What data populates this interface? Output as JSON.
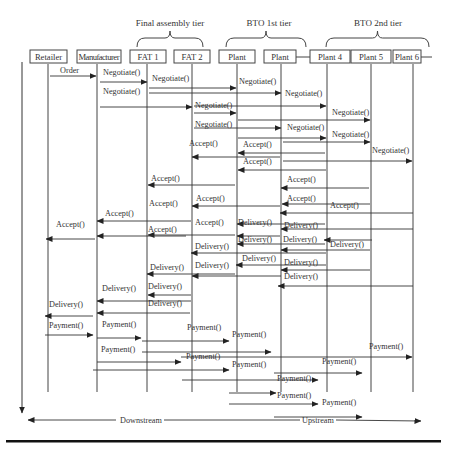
{
  "tiers": [
    {
      "label": "Final assembly tier",
      "x1": 137,
      "x2": 203,
      "tx": 170,
      "ty": 26
    },
    {
      "label": "BTO 1st tier",
      "x1": 226,
      "x2": 306,
      "tx": 269,
      "ty": 26
    },
    {
      "label": "BTO 2nd tier",
      "x1": 326,
      "x2": 429,
      "tx": 378,
      "ty": 26
    }
  ],
  "actors": [
    {
      "label": "Retailer",
      "x": 30,
      "y": 50,
      "w": 37,
      "lx": 48
    },
    {
      "label": "Manufacturer",
      "x": 77,
      "y": 50,
      "w": 44,
      "lx": 97
    },
    {
      "label": "FAT 1",
      "x": 130,
      "y": 50,
      "w": 36,
      "lx": 147
    },
    {
      "label": "FAT 2",
      "x": 174,
      "y": 50,
      "w": 36,
      "lx": 192
    },
    {
      "label": "Plant",
      "x": 219,
      "y": 50,
      "w": 36,
      "lx": 237
    },
    {
      "label": "Plant",
      "x": 264,
      "y": 50,
      "w": 32,
      "lx": 281
    },
    {
      "label": "Plant 4",
      "x": 310,
      "y": 50,
      "w": 40,
      "lx": 327
    },
    {
      "label": "Plant 5",
      "x": 351,
      "y": 50,
      "w": 40,
      "lx": 371
    },
    {
      "label": "Plant 6",
      "x": 393,
      "y": 50,
      "w": 28,
      "lx": 413
    }
  ],
  "lifeline_end": 392,
  "messages": [
    {
      "label": "Order",
      "from": 50,
      "to": 96,
      "y": 76,
      "tx": 60,
      "ty": 73
    },
    {
      "label": "Negotiate()",
      "from": 100,
      "to": 147,
      "y": 82,
      "tx": 103,
      "ty": 75
    },
    {
      "label": "Negotiate()",
      "from": 149,
      "to": 236,
      "y": 88,
      "tx": 152,
      "ty": 81
    },
    {
      "label": "Negotiate()",
      "from": 149,
      "to": 281,
      "y": 93,
      "tx": 239,
      "ty": 84
    },
    {
      "label": "Negotiate()",
      "from": 100,
      "to": 192,
      "y": 107,
      "tx": 103,
      "ty": 94
    },
    {
      "label": "Negotiate()",
      "from": 194,
      "to": 326,
      "y": 106,
      "tx": 285,
      "ty": 96
    },
    {
      "label": "Negotiate()",
      "from": 194,
      "to": 236,
      "y": 113,
      "tx": 195,
      "ty": 108
    },
    {
      "label": "Negotiate()",
      "from": 238,
      "to": 370,
      "y": 120,
      "tx": 332,
      "ty": 115
    },
    {
      "label": "Negotiate()",
      "from": 194,
      "to": 281,
      "y": 128,
      "tx": 195,
      "ty": 127
    },
    {
      "label": "Negotiate()",
      "from": 238,
      "to": 326,
      "y": 138,
      "tx": 287,
      "ty": 130
    },
    {
      "label": "Negotiate()",
      "from": 283,
      "to": 370,
      "y": 142,
      "tx": 332,
      "ty": 137
    },
    {
      "label": "Negotiate()",
      "from": 283,
      "to": 412,
      "y": 161,
      "tx": 372,
      "ty": 153
    },
    {
      "label": "Accept()",
      "from": 325,
      "to": 238,
      "y": 153,
      "tx": 243,
      "ty": 147
    },
    {
      "label": "Accept()",
      "from": 280,
      "to": 192,
      "y": 157,
      "tx": 189,
      "ty": 146
    },
    {
      "label": "Accept()",
      "from": 326,
      "to": 238,
      "y": 170,
      "tx": 243,
      "ty": 164
    },
    {
      "label": "Accept()",
      "from": 235,
      "to": 148,
      "y": 185,
      "tx": 151,
      "ty": 181
    },
    {
      "label": "Accept()",
      "from": 369,
      "to": 281,
      "y": 188,
      "tx": 287,
      "ty": 182
    },
    {
      "label": "Accept()",
      "from": 280,
      "to": 192,
      "y": 206,
      "tx": 196,
      "ty": 201
    },
    {
      "label": "Accept()",
      "from": 370,
      "to": 282,
      "y": 204,
      "tx": 287,
      "ty": 201
    },
    {
      "label": "Accept()",
      "from": 413,
      "to": 280,
      "y": 213,
      "tx": 330,
      "ty": 208
    },
    {
      "label": "Accept()",
      "from": 191,
      "to": 97,
      "y": 221,
      "tx": 105,
      "ty": 216
    },
    {
      "label": "Accept()",
      "from": 235,
      "to": 148,
      "y": 235,
      "tx": 149,
      "ty": 206
    },
    {
      "label": "Accept()",
      "from": 325,
      "to": 237,
      "y": 224,
      "tx": 195,
      "ty": 225
    },
    {
      "label": "Accept()",
      "from": 95,
      "to": 46,
      "y": 239,
      "tx": 56,
      "ty": 227
    },
    {
      "label": "Accept()",
      "from": 186,
      "to": 97,
      "y": 236,
      "tx": 148,
      "ty": 232
    },
    {
      "label": "Delivery()",
      "from": 325,
      "to": 237,
      "y": 244,
      "tx": 238,
      "ty": 242
    },
    {
      "label": "Delivery()",
      "from": 413,
      "to": 281,
      "y": 229,
      "tx": 284,
      "ty": 228
    },
    {
      "label": "Delivery()",
      "from": 370,
      "to": 281,
      "y": 250,
      "tx": 283,
      "ty": 242
    },
    {
      "label": "Delivery()",
      "from": 326,
      "to": 191,
      "y": 253,
      "tx": 195,
      "ty": 249
    },
    {
      "label": "Delivery()",
      "from": 372,
      "to": 324,
      "y": 240,
      "tx": 330,
      "ty": 247
    },
    {
      "label": "Delivery()",
      "from": 280,
      "to": 237,
      "y": 236,
      "tx": 238,
      "ty": 225
    },
    {
      "label": "Delivery()",
      "from": 281,
      "to": 192,
      "y": 276,
      "tx": 195,
      "ty": 268
    },
    {
      "label": "Delivery()",
      "from": 326,
      "to": 236,
      "y": 265,
      "tx": 242,
      "ty": 261
    },
    {
      "label": "Delivery()",
      "from": 370,
      "to": 281,
      "y": 270,
      "tx": 284,
      "ty": 265
    },
    {
      "label": "Delivery()",
      "from": 235,
      "to": 147,
      "y": 274,
      "tx": 150,
      "ty": 270
    },
    {
      "label": "Delivery()",
      "from": 413,
      "to": 278,
      "y": 286,
      "tx": 284,
      "ty": 279
    },
    {
      "label": "Delivery()",
      "from": 191,
      "to": 97,
      "y": 301,
      "tx": 102,
      "ty": 291
    },
    {
      "label": "Delivery()",
      "from": 190,
      "to": 97,
      "y": 313,
      "tx": 148,
      "ty": 289
    },
    {
      "label": "Delivery()",
      "from": 191,
      "to": 148,
      "y": 295,
      "tx": 148,
      "ty": 306
    },
    {
      "label": "Delivery()",
      "from": 93,
      "to": 45,
      "y": 316,
      "tx": 49,
      "ty": 307
    },
    {
      "label": "Payment()",
      "from": 45,
      "to": 93,
      "y": 335,
      "tx": 49,
      "ty": 328
    },
    {
      "label": "Payment()",
      "from": 97,
      "to": 141,
      "y": 338,
      "tx": 102,
      "ty": 327
    },
    {
      "label": "Payment()",
      "from": 142,
      "to": 271,
      "y": 352,
      "tx": 187,
      "ty": 330
    },
    {
      "label": "Payment()",
      "from": 142,
      "to": 229,
      "y": 341,
      "tx": 232,
      "ty": 337
    },
    {
      "label": "Payment()",
      "from": 97,
      "to": 181,
      "y": 362,
      "tx": 101,
      "ty": 352
    },
    {
      "label": "Payment()",
      "from": 181,
      "to": 412,
      "y": 357,
      "tx": 369,
      "ty": 349
    },
    {
      "label": "Payment()",
      "from": 93,
      "to": 229,
      "y": 370,
      "tx": 186,
      "ty": 359
    },
    {
      "label": "Payment()",
      "from": 274,
      "to": 362,
      "y": 373,
      "tx": 322,
      "ty": 364
    },
    {
      "label": "Payment()",
      "from": 182,
      "to": 318,
      "y": 380,
      "tx": 232,
      "ty": 367
    },
    {
      "label": "Payment()",
      "from": 229,
      "to": 276,
      "y": 393,
      "tx": 277,
      "ty": 381
    },
    {
      "label": "Payment()",
      "from": 229,
      "to": 318,
      "y": 404,
      "tx": 322,
      "ty": 405
    },
    {
      "label": "Payment()",
      "from": 274,
      "to": 362,
      "y": 417,
      "tx": 277,
      "ty": 398
    }
  ],
  "bottom": {
    "downstream_label": "Downstream",
    "upstream_label": "Upstream",
    "y": 419
  },
  "time_arrow": {
    "x": 22,
    "y1": 62,
    "y2": 413
  }
}
